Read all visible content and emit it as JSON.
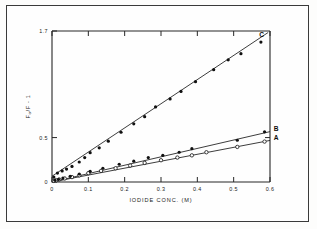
{
  "figure": {
    "caption_present": false,
    "background": "#fdfdfc",
    "frame_color": "#3a3a3a"
  },
  "chart_data": {
    "type": "scatter",
    "title": "",
    "xlabel": "IODIDE CONC.  (M)",
    "ylabel": "F0/F - 1",
    "ylabel_parts": {
      "f_zero": "F",
      "sub": "o",
      "slash": "/F",
      "minus_one": " - 1"
    },
    "xlim": [
      0,
      0.6
    ],
    "ylim": [
      0,
      1.7
    ],
    "xticks": [
      0,
      0.1,
      0.2,
      0.3,
      0.4,
      0.5,
      0.6
    ],
    "xticklabels": [
      "0",
      "0.1",
      "0.2",
      "0.3",
      "0.4",
      "0.5",
      "0.6"
    ],
    "yticks": [
      0,
      0.5,
      1.7
    ],
    "yticklabels": [
      "0",
      "0.5",
      "1.7"
    ],
    "grid": false,
    "legend_position": "inline-right-of-curves",
    "marker_colors": {
      "filled": "#111111",
      "open": "#ffffff"
    },
    "line_color": "#1a1a1a",
    "series": [
      {
        "name": "A",
        "label": "A",
        "marker": "open-circle",
        "label_x": 0.605,
        "label_y": 0.495,
        "fit": {
          "intercept": 0.0,
          "slope": 0.78
        },
        "x": [
          0.005,
          0.012,
          0.02,
          0.035,
          0.055,
          0.075,
          0.1,
          0.135,
          0.175,
          0.215,
          0.255,
          0.3,
          0.345,
          0.385,
          0.425,
          0.51,
          0.585
        ],
        "y": [
          0.012,
          0.02,
          0.028,
          0.04,
          0.055,
          0.075,
          0.1,
          0.125,
          0.155,
          0.185,
          0.215,
          0.245,
          0.275,
          0.3,
          0.335,
          0.395,
          0.455
        ]
      },
      {
        "name": "B",
        "label": "B",
        "marker": "filled-circle",
        "label_x": 0.605,
        "label_y": 0.6,
        "fit": {
          "intercept": 0.0,
          "slope": 0.945
        },
        "x": [
          0.008,
          0.018,
          0.03,
          0.05,
          0.075,
          0.105,
          0.14,
          0.185,
          0.225,
          0.265,
          0.305,
          0.35,
          0.385,
          0.51,
          0.585
        ],
        "y": [
          0.02,
          0.03,
          0.045,
          0.065,
          0.09,
          0.12,
          0.155,
          0.2,
          0.235,
          0.275,
          0.3,
          0.335,
          0.375,
          0.47,
          0.565
        ]
      },
      {
        "name": "C",
        "label": "C",
        "marker": "filled-circle",
        "label_x": 0.565,
        "label_y": 1.665,
        "fit": {
          "intercept": 0.065,
          "slope": 2.72
        },
        "x": [
          0.005,
          0.015,
          0.028,
          0.04,
          0.055,
          0.075,
          0.09,
          0.105,
          0.13,
          0.155,
          0.19,
          0.225,
          0.255,
          0.285,
          0.325,
          0.355,
          0.395,
          0.445,
          0.485,
          0.52,
          0.575
        ],
        "y": [
          0.055,
          0.1,
          0.125,
          0.145,
          0.175,
          0.225,
          0.275,
          0.33,
          0.385,
          0.46,
          0.56,
          0.655,
          0.735,
          0.845,
          0.935,
          1.02,
          1.13,
          1.265,
          1.375,
          1.445,
          1.575
        ]
      }
    ]
  }
}
